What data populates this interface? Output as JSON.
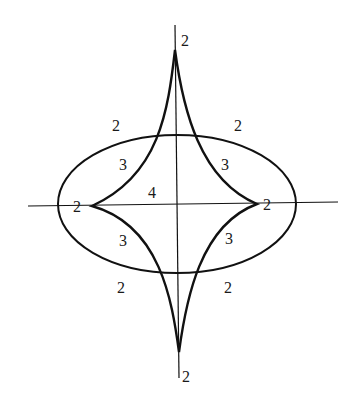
{
  "diagram": {
    "colors": {
      "stroke": "#111111",
      "background": "#ffffff",
      "text": "#1a1a1a"
    },
    "labels": {
      "top_cusp": "2",
      "bottom_cusp": "2",
      "left_cusp": "2",
      "right_cusp": "2",
      "upper_left_outer": "2",
      "upper_right_outer": "2",
      "lower_left_outer": "2",
      "lower_right_outer": "2",
      "upper_left_inner": "3",
      "upper_right_inner": "3",
      "lower_left_inner": "3",
      "lower_right_inner": "3",
      "center": "4"
    }
  }
}
